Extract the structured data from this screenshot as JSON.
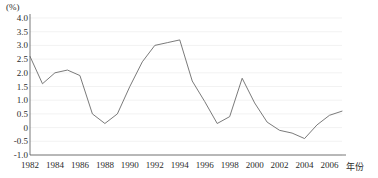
{
  "chart_data": {
    "type": "line",
    "title": "",
    "subtitle": "",
    "ylabel": "(%)",
    "xlabel": "年份",
    "ylim": [
      -1.0,
      4.0
    ],
    "xlim": [
      1982,
      2007
    ],
    "grid": true,
    "legend": null,
    "y_ticks": [
      "4.0",
      "3.5",
      "3.0",
      "2.5",
      "2.0",
      "1.5",
      "1.0",
      "0.5",
      "0",
      "-0.5",
      "-1.0"
    ],
    "y_tick_values": [
      4.0,
      3.5,
      3.0,
      2.5,
      2.0,
      1.5,
      1.0,
      0.5,
      0,
      -0.5,
      -1.0
    ],
    "x_ticks": [
      "1982",
      "1984",
      "1986",
      "1988",
      "1990",
      "1992",
      "1994",
      "1996",
      "1998",
      "2000",
      "2002",
      "2004",
      "2006"
    ],
    "x_tick_values": [
      1982,
      1984,
      1986,
      1988,
      1990,
      1992,
      1994,
      1996,
      1998,
      2000,
      2002,
      2004,
      2006
    ],
    "line_color": "#6b6b6b",
    "x": [
      1982,
      1983,
      1984,
      1985,
      1986,
      1987,
      1988,
      1989,
      1990,
      1991,
      1992,
      1993,
      1994,
      1995,
      1996,
      1997,
      1998,
      1999,
      2000,
      2001,
      2002,
      2003,
      2004,
      2005,
      2006,
      2007
    ],
    "values": [
      2.6,
      1.6,
      2.0,
      2.1,
      1.9,
      0.5,
      0.15,
      0.5,
      1.5,
      2.4,
      3.0,
      3.1,
      3.2,
      1.7,
      0.95,
      0.15,
      0.4,
      1.8,
      0.9,
      0.2,
      -0.1,
      -0.2,
      -0.4,
      0.1,
      0.45,
      0.6
    ],
    "series_name": ""
  }
}
